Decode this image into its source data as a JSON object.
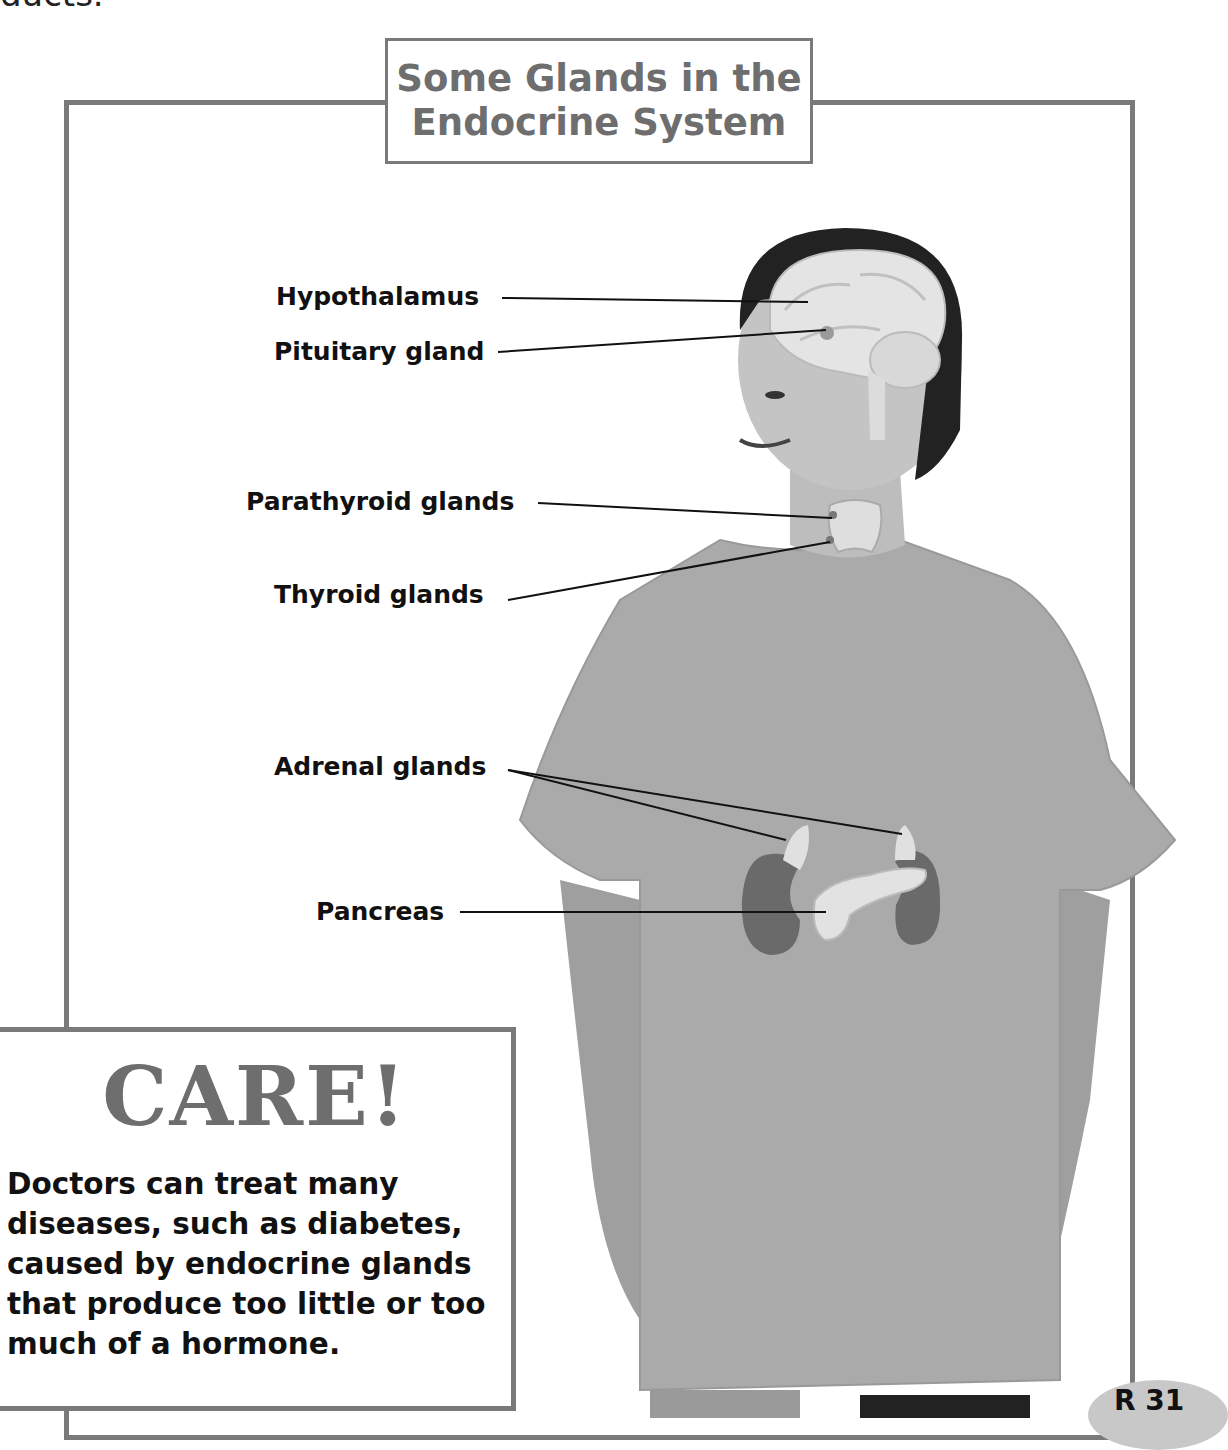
{
  "page": {
    "top_fragment": "ducts.",
    "page_number": "R 31"
  },
  "diagram": {
    "title_line1": "Some Glands in the",
    "title_line2": "Endocrine System",
    "labels": [
      {
        "text": "Hypothalamus"
      },
      {
        "text": "Pituitary gland"
      },
      {
        "text": "Parathyroid glands"
      },
      {
        "text": "Thyroid glands"
      },
      {
        "text": "Adrenal glands"
      },
      {
        "text": "Pancreas"
      }
    ]
  },
  "care_box": {
    "title": "CARE!",
    "body": "Doctors can treat many diseases, such as diabetes, caused by endocrine glands that produce too little or too much of a hormone."
  },
  "colors": {
    "frame": "#7a7a7a",
    "title_text": "#6e6e6e",
    "shirt": "#a9a9a9",
    "organ": "#6a6a6a",
    "page_badge": "#c8c8c8"
  }
}
